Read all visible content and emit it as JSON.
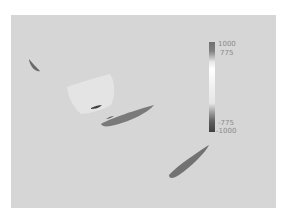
{
  "image": {
    "description": "Grayscale cross-sectional scan slice with sparse dark elongated regions and a colorbar",
    "background_color": "#d6d6d6"
  },
  "colorbar": {
    "labels": {
      "max": "1000",
      "upper": "775",
      "lower": "-775",
      "min": "-1000"
    },
    "colors": {
      "top": "#707070",
      "middle": "#ffffff",
      "bottom": "#404040"
    }
  },
  "regions": [
    {
      "name": "small-dark-streak-left",
      "color": "#6a6a6a"
    },
    {
      "name": "light-patch",
      "color": "#e4e4e4"
    },
    {
      "name": "small-dark-slit",
      "color": "#404040"
    },
    {
      "name": "elongated-dark-region-center",
      "color": "#7a7a7a"
    },
    {
      "name": "elongated-dark-region-lower-right",
      "color": "#727272"
    }
  ]
}
